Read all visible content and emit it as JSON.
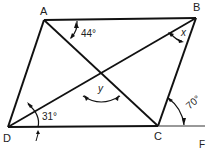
{
  "diagram": {
    "type": "parallelogram",
    "vertices": {
      "A": {
        "label": "A",
        "x": 44,
        "y": 20
      },
      "B": {
        "label": "B",
        "x": 196,
        "y": 18
      },
      "C": {
        "label": "C",
        "x": 158,
        "y": 126
      },
      "D": {
        "label": "D",
        "x": 8,
        "y": 127
      }
    },
    "angles": {
      "A": "44°",
      "B": "x",
      "D": "31°",
      "C_exterior": "70°",
      "center": "y"
    },
    "caption_fragment": "F"
  }
}
